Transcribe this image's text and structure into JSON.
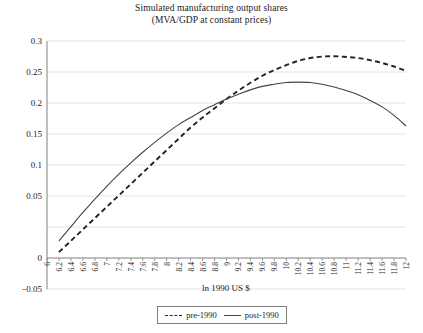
{
  "chart_data": {
    "type": "line",
    "title": "Simulated manufacturing output shares",
    "subtitle": "(MVA/GDP at constant prices)",
    "xlabel": "ln 1990 US $",
    "ylabel": "",
    "xlim": [
      6,
      12
    ],
    "ylim": [
      -0.05,
      0.3
    ],
    "grid": true,
    "legend_position": "bottom",
    "x_ticks": [
      "6",
      "6.2",
      "6.4",
      "6.6",
      "6.8",
      "7",
      "7.2",
      "7.4",
      "7.6",
      "7.8",
      "8",
      "8.2",
      "8.4",
      "8.6",
      "8.8",
      "9",
      "9.2",
      "9.4",
      "9.6",
      "9.8",
      "10",
      "10.2",
      "10.4",
      "10.6",
      "10.8",
      "11",
      "11.2",
      "11.4",
      "11.6",
      "11.8",
      "12"
    ],
    "y_ticks": [
      "-0.05",
      "0",
      "0.05",
      "0.1",
      "0.15",
      "0.2",
      "0.25",
      "0.3"
    ],
    "x": [
      6.2,
      6.4,
      6.6,
      6.8,
      7.0,
      7.2,
      7.4,
      7.6,
      7.8,
      8.0,
      8.2,
      8.4,
      8.6,
      8.8,
      9.0,
      9.2,
      9.4,
      9.6,
      9.8,
      10.0,
      10.2,
      10.4,
      10.6,
      10.8,
      11.0,
      11.2,
      11.4,
      11.6,
      11.8,
      12.0
    ],
    "series": [
      {
        "name": "pre-1990",
        "style": "dashed",
        "color": "#222222",
        "values": [
          0.002,
          0.018,
          0.034,
          0.05,
          0.066,
          0.082,
          0.098,
          0.114,
          0.13,
          0.146,
          0.162,
          0.178,
          0.192,
          0.205,
          0.218,
          0.23,
          0.241,
          0.251,
          0.259,
          0.266,
          0.272,
          0.276,
          0.278,
          0.2785,
          0.2775,
          0.276,
          0.273,
          0.269,
          0.264,
          0.258
        ]
      },
      {
        "name": "post-1990",
        "style": "solid",
        "color": "#444444",
        "values": [
          0.018,
          0.038,
          0.058,
          0.077,
          0.095,
          0.112,
          0.128,
          0.143,
          0.157,
          0.17,
          0.182,
          0.192,
          0.202,
          0.21,
          0.218,
          0.225,
          0.231,
          0.236,
          0.239,
          0.2415,
          0.242,
          0.2415,
          0.239,
          0.235,
          0.23,
          0.224,
          0.216,
          0.207,
          0.195,
          0.18
        ]
      }
    ]
  },
  "legend": {
    "items": [
      {
        "label": "pre-1990",
        "style": "dashed"
      },
      {
        "label": "post-1990",
        "style": "solid"
      }
    ]
  },
  "colors": {
    "grid": "#e3e3e3",
    "axis": "#808080",
    "text": "#1a1a1a",
    "background": "#ffffff"
  }
}
